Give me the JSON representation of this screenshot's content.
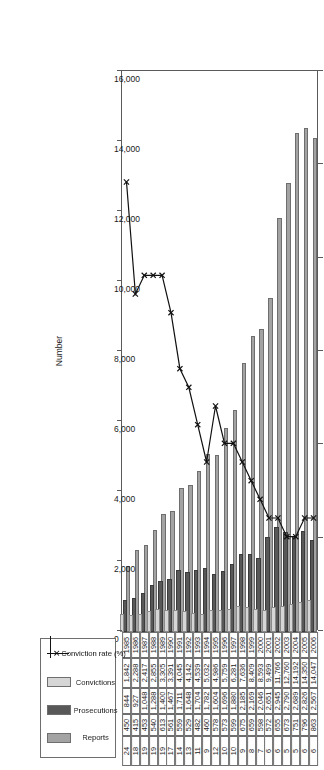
{
  "chart_data": {
    "type": "bar",
    "title": "",
    "xlabel": "",
    "ylabel": "Number",
    "secondary_axis_label": "%",
    "ylim": [
      0,
      16000
    ],
    "secondary_ylim": [
      0,
      30
    ],
    "grid": false,
    "legend_position": "bottom-right",
    "categories": [
      "1985",
      "1986",
      "1987",
      "1988",
      "1989",
      "1990",
      "1991",
      "1992",
      "1993",
      "1994",
      "1995",
      "1996",
      "1997",
      "1998",
      "1999",
      "2000",
      "2001",
      "2002",
      "2003",
      "2004",
      "2005",
      "2006"
    ],
    "y_ticks": [
      "0",
      "2,000",
      "4,000",
      "6,000",
      "8,000",
      "10,000",
      "12,000",
      "14,000",
      "16,000"
    ],
    "secondary_ticks": [
      "0",
      "5",
      "10",
      "15",
      "20",
      "25",
      "30"
    ],
    "series": [
      {
        "name": "Reports",
        "type": "bar",
        "color": "#a3a3a3",
        "axis": "primary",
        "values": [
          1842,
          2288,
          2417,
          2855,
          3305,
          3391,
          4045,
          4142,
          4539,
          5032,
          4986,
          5759,
          6281,
          7636,
          8409,
          8593,
          9499,
          11766,
          12760,
          14192,
          14350,
          14047
        ]
      },
      {
        "name": "Prosecutions",
        "type": "bar",
        "color": "#585858",
        "axis": "primary",
        "values": [
          844,
          927,
          1048,
          1288,
          1400,
          1467,
          1711,
          1648,
          1704,
          1782,
          1604,
          1696,
          1880,
          2185,
          2169,
          2046,
          2651,
          2945,
          2790,
          2689,
          2826,
          2567
        ]
      },
      {
        "name": "Convictions",
        "type": "bar",
        "color": "#d6d6d6",
        "axis": "primary",
        "values": [
          450,
          415,
          453,
          540,
          613,
          561,
          559,
          529,
          482,
          460,
          578,
          573,
          599,
          675,
          659,
          598,
          572,
          655,
          673,
          751,
          796,
          863
        ]
      },
      {
        "name": "Conviction rate (%)",
        "type": "line",
        "color": "#111111",
        "axis": "secondary",
        "marker": "x",
        "values": [
          24,
          18,
          19,
          19,
          19,
          17,
          14,
          13,
          11,
          9,
          12,
          10,
          10,
          9,
          8,
          7,
          6,
          6,
          5,
          5,
          6,
          6
        ]
      }
    ]
  },
  "table": {
    "row_labels": [
      "Reports",
      "Prosecutions",
      "Convictions",
      "Conviction rate (%)"
    ],
    "year_header": [
      "1985",
      "1986",
      "1987",
      "1988",
      "1989",
      "1990",
      "1991",
      "1992",
      "1993",
      "1994",
      "1995",
      "1996",
      "1997",
      "1998",
      "1999",
      "2000",
      "2001",
      "2002",
      "2003",
      "2004",
      "2005",
      "2006"
    ],
    "rows": [
      [
        "1,842",
        "2,288",
        "2,417",
        "2,855",
        "3,305",
        "3,391",
        "4,045",
        "4,142",
        "4,539",
        "5,032",
        "4,986",
        "5,759",
        "6,281",
        "7,636",
        "8,409",
        "8,593",
        "9,499",
        "11,766",
        "12,760",
        "14,192",
        "14,350",
        "14,047"
      ],
      [
        "844",
        "927",
        "1,048",
        "1,288",
        "1,400",
        "1,467",
        "1,711",
        "1,648",
        "1,704",
        "1,782",
        "1,604",
        "1,696",
        "1,880",
        "2,185",
        "2,169",
        "2,046",
        "2,651",
        "2,945",
        "2,790",
        "2,689",
        "2,826",
        "2,567"
      ],
      [
        "450",
        "415",
        "453",
        "540",
        "613",
        "561",
        "559",
        "529",
        "482",
        "460",
        "578",
        "573",
        "599",
        "675",
        "659",
        "598",
        "572",
        "655",
        "673",
        "751",
        "796",
        "863"
      ],
      [
        "24",
        "18",
        "19",
        "19",
        "19",
        "17",
        "14",
        "13",
        "11",
        "9",
        "12",
        "10",
        "10",
        "9",
        "8",
        "7",
        "6",
        "6",
        "5",
        "5",
        "6",
        "6"
      ]
    ]
  },
  "axes": {
    "primary_label": "Number",
    "secondary_label": "%",
    "primary_ticks": [
      "0",
      "2,000",
      "4,000",
      "6,000",
      "8,000",
      "10,000",
      "12,000",
      "14,000",
      "16,000"
    ],
    "secondary_ticks": [
      "0",
      "5",
      "10",
      "15",
      "20",
      "25",
      "30"
    ]
  },
  "legend": {
    "items": [
      {
        "label": "Reports",
        "marker": "swatch",
        "color": "#a3a3a3"
      },
      {
        "label": "Prosecutions",
        "marker": "swatch",
        "color": "#585858"
      },
      {
        "label": "Convictions",
        "marker": "swatch",
        "color": "#d6d6d6"
      },
      {
        "label": "Conviction rate (%)",
        "marker": "line-x",
        "color": "#111111"
      }
    ]
  }
}
